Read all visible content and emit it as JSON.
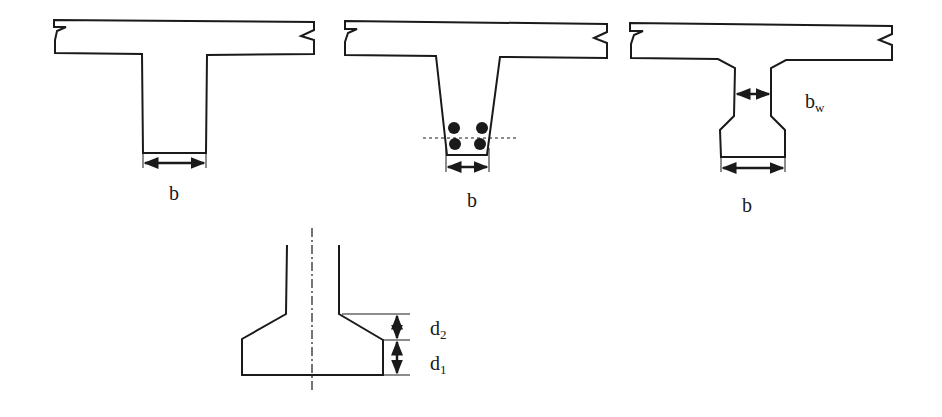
{
  "diagram": {
    "type": "T-beam cross sections",
    "stroke_color": "#1a1a1a",
    "background": "#ffffff",
    "sections": [
      {
        "id": "rectangular-web",
        "dimension_label": "b"
      },
      {
        "id": "tapered-web-with-bars",
        "dimension_label": "b",
        "bars": 4
      },
      {
        "id": "i-shaped-web",
        "dimension_label": "b",
        "web_label_main": "b",
        "web_label_sub": "w"
      }
    ],
    "detail": {
      "id": "bottom-bulb-detail",
      "labels": [
        {
          "main": "d",
          "sub": "2"
        },
        {
          "main": "d",
          "sub": "1"
        }
      ]
    }
  }
}
